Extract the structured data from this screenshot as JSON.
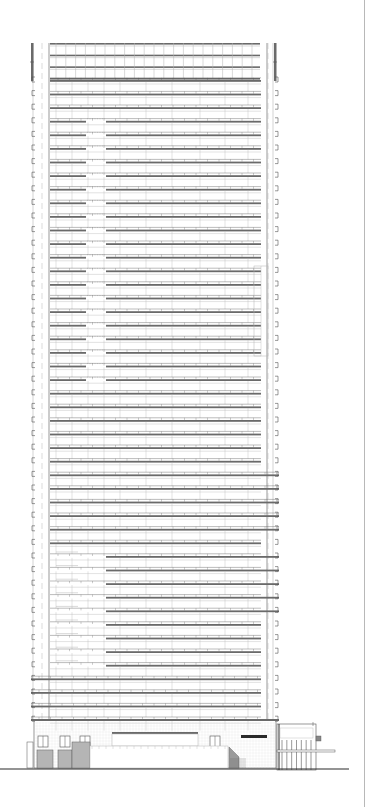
{
  "drawing": {
    "type": "architectural-elevation",
    "subject": "high-rise residential tower",
    "canvas": {
      "width": 371,
      "height": 807
    },
    "colors": {
      "background": "#ffffff",
      "line": "#555555",
      "light_line": "#b5b5b5",
      "balcony": "#6a6a6a",
      "dark_accent": "#2a2a2a",
      "border": "#b8b8b8"
    },
    "tower": {
      "left": 31,
      "right": 279,
      "core_left": 49,
      "core_right": 262,
      "top": 43,
      "podium_top": 720,
      "typical_floor_count": 48,
      "floor_height": 13.6,
      "first_floor_y": 80,
      "crown": {
        "levels": 3,
        "top": 43,
        "bottom": 78
      }
    },
    "podium": {
      "top": 720,
      "bottom": 768,
      "left": 31,
      "right": 279,
      "windows": [
        {
          "x": 38,
          "y": 736,
          "w": 10,
          "h": 11
        },
        {
          "x": 60,
          "y": 736,
          "w": 10,
          "h": 11
        },
        {
          "x": 80,
          "y": 736,
          "w": 10,
          "h": 11
        },
        {
          "x": 210,
          "y": 736,
          "w": 10,
          "h": 11
        }
      ],
      "garage_doors": [
        {
          "x": 37,
          "y": 750,
          "w": 16,
          "h": 18
        },
        {
          "x": 58,
          "y": 750,
          "w": 14,
          "h": 18
        },
        {
          "x": 72,
          "y": 742,
          "w": 18,
          "h": 26
        }
      ],
      "canopy": {
        "x": 112,
        "y": 732,
        "w": 86,
        "h": 2
      },
      "sign_bar": {
        "x": 241,
        "y": 735,
        "w": 26,
        "h": 3
      },
      "stair": {
        "x": 229,
        "y": 747,
        "w": 22,
        "h": 21
      }
    },
    "annex": {
      "left": 277,
      "right": 316,
      "top": 724,
      "bottom": 770,
      "mullion_count": 7
    },
    "ground_line": {
      "y": 769,
      "x1": 0,
      "x2": 349
    },
    "labels": []
  }
}
